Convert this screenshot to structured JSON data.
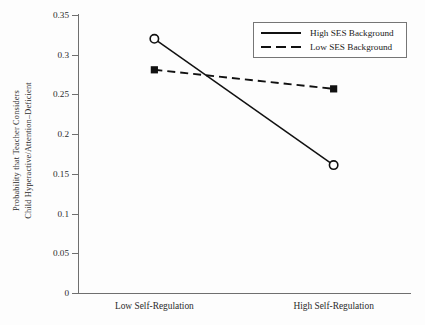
{
  "chart_data": {
    "type": "line",
    "title": "",
    "subtitle": "",
    "xlabel": "",
    "ylabel_line1": "Probability that Teacher Considers",
    "ylabel_line2": "Child Hyperactive/Attention–Deficient",
    "categories": [
      "Low Self-Regulation",
      "High Self-Regulation"
    ],
    "ylim": [
      0,
      0.35
    ],
    "yticks": [
      0,
      0.05,
      0.1,
      0.15,
      0.2,
      0.25,
      0.3,
      0.35
    ],
    "ytick_labels": [
      "0",
      "0.05",
      "0.1",
      "0.15",
      "0.2",
      "0.25",
      "0.3",
      "0.35"
    ],
    "grid": false,
    "legend_position": "top-right",
    "series": [
      {
        "name": "High SES Background",
        "values": [
          0.32,
          0.161
        ],
        "line_style": "solid",
        "marker": "open-circle",
        "color": "#111111"
      },
      {
        "name": "Low SES Background",
        "values": [
          0.281,
          0.257
        ],
        "line_style": "dashed",
        "marker": "filled-square",
        "color": "#111111"
      }
    ]
  },
  "legend": {
    "entries": [
      {
        "label": "High SES Background",
        "style": "solid"
      },
      {
        "label": "Low SES Background",
        "style": "dashed"
      }
    ]
  },
  "colors": {
    "axis": "#6f6f6f",
    "data": "#111111",
    "text": "#2b2b2b",
    "background": "#fdfdfd"
  }
}
